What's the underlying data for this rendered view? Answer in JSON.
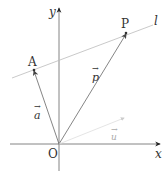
{
  "diagram": {
    "type": "vector-line-equation",
    "axes": {
      "x_label": "x",
      "y_label": "y",
      "origin_label": "O"
    },
    "points": [
      {
        "id": "A",
        "label": "A"
      },
      {
        "id": "P",
        "label": "P"
      }
    ],
    "line": {
      "label": "l"
    },
    "vectors": [
      {
        "id": "a",
        "label": "a",
        "from": "O",
        "to": "A"
      },
      {
        "id": "p",
        "label": "p",
        "from": "O",
        "to": "P"
      },
      {
        "id": "u",
        "label": "u",
        "from": "O",
        "note": "direction vector (faint)"
      }
    ],
    "arrow_glyph": "→",
    "colors": {
      "axis": "#555555",
      "vector": "#777777",
      "line": "#bbbbbb",
      "faint_vector": "#cccccc",
      "text": "#333333"
    }
  }
}
